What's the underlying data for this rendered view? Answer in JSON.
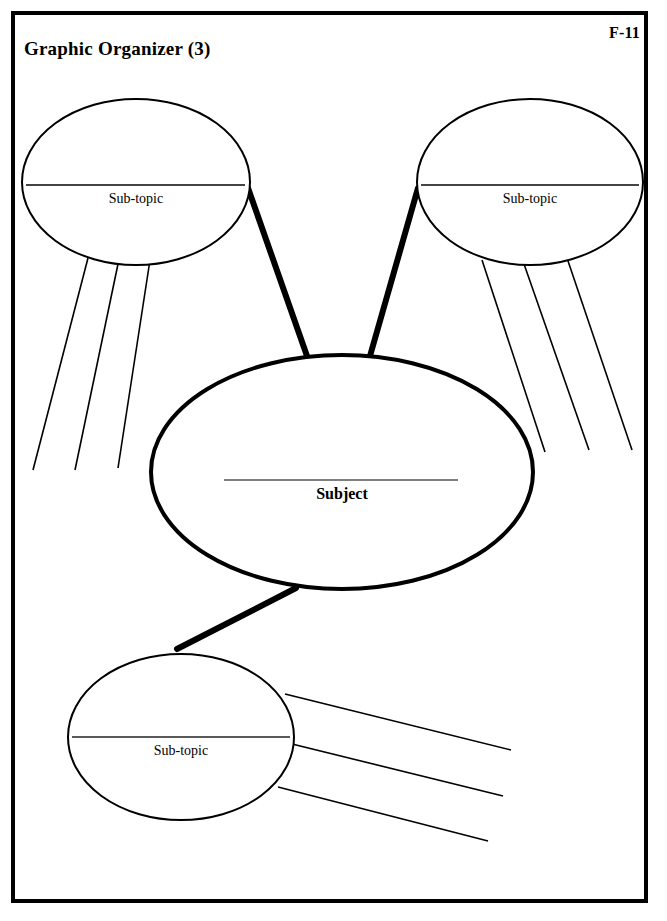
{
  "page": {
    "title": "Graphic Organizer (3)",
    "code": "F-11",
    "background_color": "#ffffff",
    "ink_color": "#000000",
    "frame_color": "#000000"
  },
  "diagram": {
    "type": "concept-map",
    "center_node": {
      "label": "Subject",
      "shape": "ellipse",
      "cx": 342,
      "cy": 472,
      "rx": 191,
      "ry": 117,
      "stroke_width": 4,
      "writing_line": {
        "x1": 224,
        "x2": 458,
        "y": 480
      }
    },
    "sub_nodes": [
      {
        "id": "sub-topic-top-left",
        "label": "Sub-topic",
        "shape": "ellipse",
        "cx": 136,
        "cy": 182,
        "rx": 114,
        "ry": 83,
        "stroke_width": 2,
        "writing_line": {
          "x1": 26,
          "x2": 245,
          "y": 185
        },
        "detail_line_count": 3
      },
      {
        "id": "sub-topic-top-right",
        "label": "Sub-topic",
        "shape": "ellipse",
        "cx": 530,
        "cy": 182,
        "rx": 113,
        "ry": 83,
        "stroke_width": 2,
        "writing_line": {
          "x1": 421,
          "x2": 639,
          "y": 185
        },
        "detail_line_count": 3
      },
      {
        "id": "sub-topic-bottom",
        "label": "Sub-topic",
        "shape": "ellipse",
        "cx": 181,
        "cy": 737,
        "rx": 113,
        "ry": 83,
        "stroke_width": 2,
        "writing_line": {
          "x1": 72,
          "x2": 290,
          "y": 737
        },
        "detail_line_count": 3
      }
    ],
    "connectors": [
      {
        "id": "connector-center-to-top-left",
        "from": "center",
        "to": "sub-topic-top-left",
        "x1": 307,
        "y1": 356,
        "x2": 248,
        "y2": 188,
        "stroke_width": 6
      },
      {
        "id": "connector-center-to-top-right",
        "from": "center",
        "to": "sub-topic-top-right",
        "x1": 370,
        "y1": 356,
        "x2": 418,
        "y2": 188,
        "stroke_width": 6
      },
      {
        "id": "connector-center-to-bottom",
        "from": "center",
        "to": "sub-topic-bottom",
        "x1": 296,
        "y1": 588,
        "x2": 177,
        "y2": 649,
        "stroke_width": 6
      }
    ],
    "detail_lines": [
      {
        "id": "detail-line-tl-1",
        "node": "sub-topic-top-left",
        "x1": 88,
        "y1": 258,
        "x2": 33,
        "y2": 470
      },
      {
        "id": "detail-line-tl-2",
        "node": "sub-topic-top-left",
        "x1": 118,
        "y1": 264,
        "x2": 75,
        "y2": 470
      },
      {
        "id": "detail-line-tl-3",
        "node": "sub-topic-top-left",
        "x1": 150,
        "y1": 260,
        "x2": 118,
        "y2": 468
      },
      {
        "id": "detail-line-tr-1",
        "node": "sub-topic-top-right",
        "x1": 482,
        "y1": 260,
        "x2": 545,
        "y2": 452
      },
      {
        "id": "detail-line-tr-2",
        "node": "sub-topic-top-right",
        "x1": 524,
        "y1": 264,
        "x2": 589,
        "y2": 450
      },
      {
        "id": "detail-line-tr-3",
        "node": "sub-topic-top-right",
        "x1": 567,
        "y1": 258,
        "x2": 632,
        "y2": 450
      },
      {
        "id": "detail-line-b-1",
        "node": "sub-topic-bottom",
        "x1": 285,
        "y1": 694,
        "x2": 511,
        "y2": 750
      },
      {
        "id": "detail-line-b-2",
        "node": "sub-topic-bottom",
        "x1": 288,
        "y1": 743,
        "x2": 503,
        "y2": 796
      },
      {
        "id": "detail-line-b-3",
        "node": "sub-topic-bottom",
        "x1": 278,
        "y1": 787,
        "x2": 488,
        "y2": 841
      }
    ]
  }
}
